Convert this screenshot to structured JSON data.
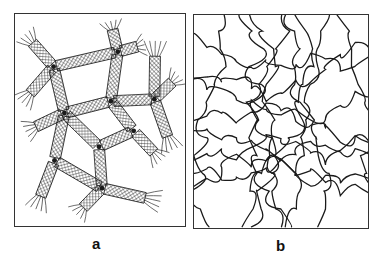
{
  "figure": {
    "panels": [
      {
        "id": "a",
        "label": "a",
        "description": "network of crystalline ribbon bundles joined at junctions with frayed chain ends"
      },
      {
        "id": "b",
        "label": "b",
        "description": "entangled random-coil polymer network"
      }
    ],
    "colors": {
      "ink": "#1a1a1a",
      "frame": "#333333",
      "background": "#ffffff"
    }
  }
}
